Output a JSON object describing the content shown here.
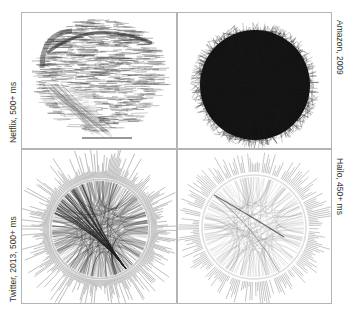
{
  "figure": {
    "panels": [
      {
        "id": "netflix",
        "caption": "Netflix, 500+ ms",
        "caption_side": "left",
        "style": "hairball-horizontal"
      },
      {
        "id": "amazon",
        "caption": "Amazon, 2009",
        "caption_side": "right",
        "style": "dense-ball"
      },
      {
        "id": "twitter",
        "caption": "Twitter, 2013, 500+ ms",
        "caption_side": "left",
        "style": "chord-dark"
      },
      {
        "id": "hailo",
        "caption": "Hailo, 450+ ms",
        "caption_side": "right",
        "style": "chord-light"
      }
    ],
    "colors": {
      "border": "#b4b4b4",
      "ink_dark": "#1a1a1a",
      "ink_mid": "#5a5a5a",
      "ink_light": "#aaaaaa",
      "caption": "#333333"
    }
  }
}
